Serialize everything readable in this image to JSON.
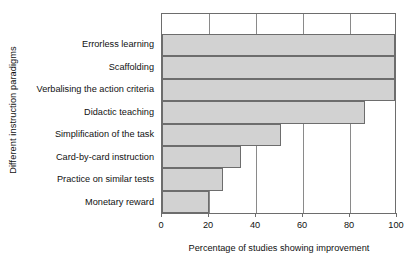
{
  "chart_data": {
    "type": "bar",
    "orientation": "horizontal",
    "title": "",
    "xlabel": "Percentage of studies showing improvement",
    "ylabel": "Different instruction paradigms",
    "categories": [
      "Errorless learning",
      "Scaffolding",
      "Verbalising the action criteria",
      "Didactic teaching",
      "Simplification of the task",
      "Card-by-card instruction",
      "Practice on similar tests",
      "Monetary reward"
    ],
    "values": [
      100,
      100,
      100,
      87,
      51,
      34,
      26,
      20
    ],
    "xlim": [
      0,
      100
    ],
    "xticks": [
      0,
      20,
      40,
      60,
      80,
      100
    ],
    "xtick_labels": [
      "0",
      "20",
      "40",
      "60",
      "80",
      "100"
    ],
    "grid": "vertical",
    "legend": "none",
    "bar_fill_color": "#d2d2d2",
    "bar_border_color": "#6d6d6d",
    "axis_color": "#6d6d6d",
    "text_color": "#111111"
  }
}
